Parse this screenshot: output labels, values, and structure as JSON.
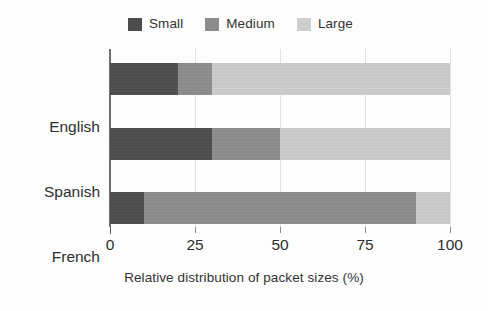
{
  "chart_data": {
    "type": "bar",
    "orientation": "horizontal",
    "stacked": true,
    "normalized": true,
    "title": "",
    "xlabel": "Relative distribution of packet sizes (%)",
    "ylabel": "",
    "categories": [
      "English",
      "Spanish",
      "French"
    ],
    "series": [
      {
        "name": "Small",
        "values": [
          20,
          30,
          10
        ],
        "color": "#4d4d4d"
      },
      {
        "name": "Medium",
        "values": [
          10,
          20,
          80
        ],
        "color": "#8c8c8c"
      },
      {
        "name": "Large",
        "values": [
          70,
          50,
          10
        ],
        "color": "#cdcdcd"
      }
    ],
    "xlim": [
      0,
      100
    ],
    "xticks": [
      0,
      25,
      50,
      75,
      100
    ],
    "xtick_labels": [
      "0",
      "25",
      "50",
      "75",
      "100"
    ],
    "grid": true,
    "grid_axis": "x",
    "legend": {
      "position": "top",
      "entries": [
        {
          "label": "Small",
          "color": "#4d4d4d"
        },
        {
          "label": "Medium",
          "color": "#8c8c8c"
        },
        {
          "label": "Large",
          "color": "#cdcdcd"
        }
      ]
    },
    "axis_color": "#6f6f6f",
    "background": "#fdfdfd"
  }
}
